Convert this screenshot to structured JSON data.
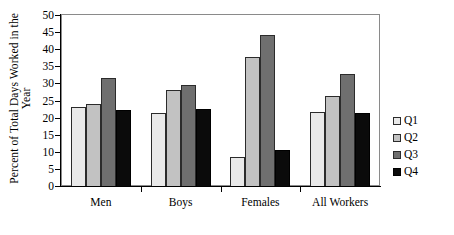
{
  "chart_data": {
    "type": "bar",
    "title": "",
    "xlabel": "",
    "ylabel_line1": "Percent of Total Days Worked in the",
    "ylabel_line2": "Year",
    "ylabel": "Percent of Total Days Worked in the Year",
    "categories": [
      "Men",
      "Boys",
      "Females",
      "All Workers"
    ],
    "series": [
      {
        "name": "Q1",
        "color": "#e9e9e9",
        "values": [
          23.0,
          21.3,
          8.5,
          21.7
        ]
      },
      {
        "name": "Q2",
        "color": "#c2c2c2",
        "values": [
          24.0,
          28.0,
          37.8,
          26.3
        ]
      },
      {
        "name": "Q3",
        "color": "#6f6f6f",
        "values": [
          31.5,
          29.4,
          44.3,
          32.8
        ]
      },
      {
        "name": "Q4",
        "color": "#0b0b0b",
        "values": [
          22.1,
          22.4,
          10.5,
          21.3
        ]
      }
    ],
    "ylim": [
      0,
      50
    ],
    "ytick_values": [
      0,
      5,
      10,
      15,
      20,
      25,
      30,
      35,
      40,
      45,
      50
    ],
    "ytick_labels": [
      "0",
      "5",
      "10",
      "15",
      "20",
      "25",
      "30",
      "35",
      "40",
      "45",
      "50"
    ],
    "grid": false,
    "legend_position": "right",
    "legend_entries": [
      "Q1",
      "Q2",
      "Q3",
      "Q4"
    ],
    "plot_border": true
  }
}
